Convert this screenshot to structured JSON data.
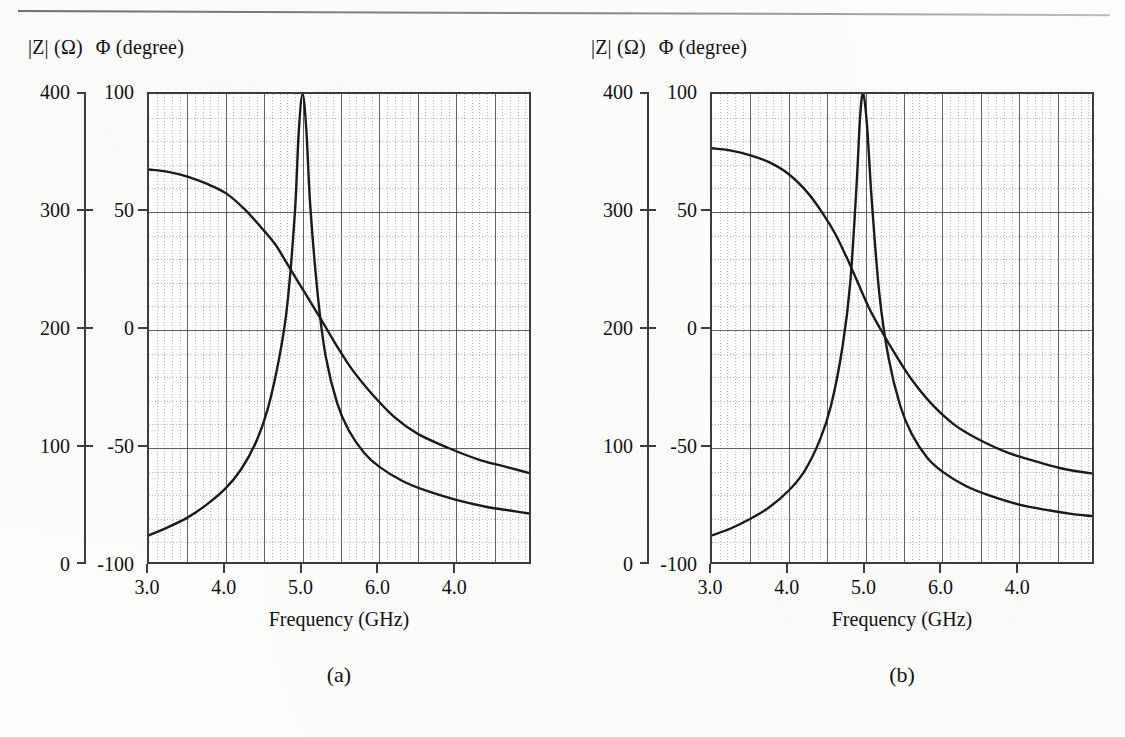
{
  "figure": {
    "kind": "two-panel-impedance-phase-plot",
    "top_rule": true
  },
  "panels": [
    {
      "caption": "(a)",
      "header": {
        "magnitude": "|Z| (Ω)",
        "phase": "Φ (degree)"
      },
      "x_axis_title": "Frequency (GHz)"
    },
    {
      "caption": "(b)",
      "header": {
        "magnitude": "|Z| (Ω)",
        "phase": "Φ (degree)"
      },
      "x_axis_title": "Frequency (GHz)"
    }
  ],
  "axes": {
    "z_ticks": [
      "400",
      "300",
      "200",
      "100",
      "0"
    ],
    "phi_ticks": [
      "100",
      "50",
      "0",
      "-50",
      "-100"
    ],
    "x_ticks": [
      "3.0",
      "4.0",
      "5.0",
      "6.0",
      "4.0"
    ]
  },
  "chart_data": [
    {
      "type": "line",
      "title": "(a)",
      "xlabel": "Frequency (GHz)",
      "ylabel": "|Z| (Ω)",
      "y2label": "Φ (degree)",
      "xlim": [
        3.0,
        8.0
      ],
      "ylim": [
        0,
        400
      ],
      "y2lim": [
        -100,
        100
      ],
      "xticks": [
        3.0,
        4.0,
        5.0,
        6.0,
        7.0
      ],
      "xticklabels": [
        "3.0",
        "4.0",
        "5.0",
        "6.0",
        "4.0"
      ],
      "yticks": [
        0,
        100,
        200,
        300,
        400
      ],
      "y2ticks": [
        -100,
        -50,
        0,
        50,
        100
      ],
      "grid": "major-and-minor",
      "legend": "none",
      "series": [
        {
          "name": "|Z| magnitude",
          "axis": "left",
          "units": "ohm",
          "resonance_frequency_ghz": 5.0,
          "peak_value_ohm": 400,
          "x": [
            3.0,
            3.25,
            3.5,
            3.75,
            4.0,
            4.2,
            4.4,
            4.55,
            4.7,
            4.8,
            4.9,
            4.95,
            5.0,
            5.05,
            5.1,
            5.2,
            5.3,
            5.45,
            5.6,
            5.8,
            6.0,
            6.3,
            6.6,
            7.0,
            7.4,
            7.7,
            8.0
          ],
          "values": [
            26,
            33,
            41,
            52,
            66,
            82,
            106,
            134,
            178,
            221,
            300,
            368,
            400,
            368,
            305,
            228,
            178,
            138,
            115,
            96,
            84,
            72,
            64,
            56,
            50,
            47,
            44
          ]
        },
        {
          "name": "Φ phase",
          "axis": "right",
          "units": "degree",
          "x": [
            3.0,
            3.25,
            3.5,
            3.75,
            4.0,
            4.25,
            4.5,
            4.65,
            4.8,
            4.95,
            5.1,
            5.25,
            5.45,
            5.65,
            5.9,
            6.2,
            6.5,
            6.9,
            7.3,
            7.65,
            8.0
          ],
          "values": [
            68,
            67,
            65,
            62,
            58,
            51,
            42,
            36,
            28,
            20,
            12,
            4,
            -7,
            -17,
            -27,
            -37,
            -44,
            -50,
            -55,
            -58,
            -61
          ]
        }
      ]
    },
    {
      "type": "line",
      "title": "(b)",
      "xlabel": "Frequency (GHz)",
      "ylabel": "|Z| (Ω)",
      "y2label": "Φ (degree)",
      "xlim": [
        3.0,
        8.0
      ],
      "ylim": [
        0,
        400
      ],
      "y2lim": [
        -100,
        100
      ],
      "xticks": [
        3.0,
        4.0,
        5.0,
        6.0,
        7.0
      ],
      "xticklabels": [
        "3.0",
        "4.0",
        "5.0",
        "6.0",
        "4.0"
      ],
      "yticks": [
        0,
        100,
        200,
        300,
        400
      ],
      "y2ticks": [
        -100,
        -50,
        0,
        50,
        100
      ],
      "grid": "major-and-minor",
      "legend": "none",
      "series": [
        {
          "name": "|Z| magnitude",
          "axis": "left",
          "units": "ohm",
          "resonance_frequency_ghz": 4.95,
          "peak_value_ohm": 400,
          "x": [
            3.0,
            3.25,
            3.5,
            3.75,
            4.0,
            4.2,
            4.4,
            4.55,
            4.7,
            4.8,
            4.88,
            4.93,
            4.97,
            5.02,
            5.08,
            5.18,
            5.3,
            5.45,
            5.6,
            5.8,
            6.0,
            6.3,
            6.6,
            7.0,
            7.4,
            7.7,
            8.0
          ],
          "values": [
            26,
            32,
            40,
            50,
            64,
            80,
            106,
            136,
            186,
            240,
            320,
            382,
            400,
            372,
            310,
            230,
            176,
            136,
            112,
            92,
            80,
            68,
            60,
            52,
            47,
            44,
            42
          ]
        },
        {
          "name": "Φ phase",
          "axis": "right",
          "units": "degree",
          "x": [
            3.0,
            3.25,
            3.5,
            3.75,
            4.0,
            4.25,
            4.45,
            4.6,
            4.75,
            4.9,
            5.05,
            5.2,
            5.4,
            5.6,
            5.85,
            6.15,
            6.45,
            6.85,
            7.25,
            7.6,
            8.0
          ],
          "values": [
            77,
            76,
            74,
            71,
            66,
            58,
            49,
            41,
            31,
            20,
            9,
            0,
            -11,
            -21,
            -31,
            -40,
            -46,
            -52,
            -56,
            -59,
            -61
          ]
        }
      ]
    }
  ]
}
